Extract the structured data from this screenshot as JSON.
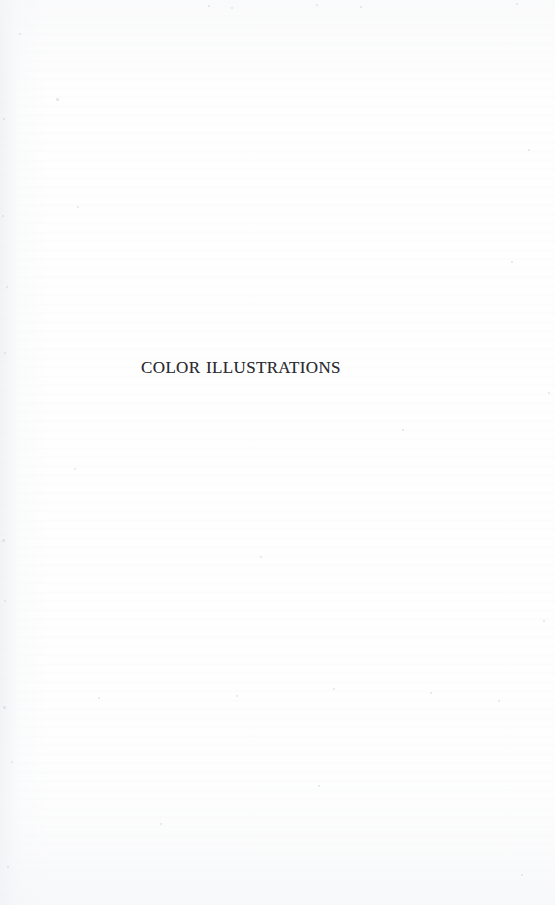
{
  "page": {
    "kind": "book-section-divider",
    "background_color": "#fefefe",
    "ink_color": "#2b2b30",
    "width": 555,
    "height": 905
  },
  "content": {
    "section_title": "COLOR ILLUSTRATIONS"
  },
  "artifacts": {
    "specks": [
      {
        "x": 19,
        "y": 33,
        "size": 2
      },
      {
        "x": 56,
        "y": 98,
        "size": 3
      },
      {
        "x": 3,
        "y": 118,
        "size": 2
      },
      {
        "x": 208,
        "y": 5,
        "size": 2
      },
      {
        "x": 231,
        "y": 7,
        "size": 2
      },
      {
        "x": 316,
        "y": 4,
        "size": 2
      },
      {
        "x": 360,
        "y": 6,
        "size": 2
      },
      {
        "x": 516,
        "y": 3,
        "size": 2
      },
      {
        "x": 2,
        "y": 215,
        "size": 2
      },
      {
        "x": 6,
        "y": 286,
        "size": 2
      },
      {
        "x": 4,
        "y": 352,
        "size": 2
      },
      {
        "x": 74,
        "y": 468,
        "size": 2
      },
      {
        "x": 402,
        "y": 429,
        "size": 2
      },
      {
        "x": 77,
        "y": 206,
        "size": 2
      },
      {
        "x": 2,
        "y": 539,
        "size": 3
      },
      {
        "x": 4,
        "y": 600,
        "size": 2
      },
      {
        "x": 3,
        "y": 706,
        "size": 3
      },
      {
        "x": 11,
        "y": 761,
        "size": 2
      },
      {
        "x": 7,
        "y": 866,
        "size": 2
      },
      {
        "x": 260,
        "y": 556,
        "size": 2
      },
      {
        "x": 333,
        "y": 688,
        "size": 2
      },
      {
        "x": 98,
        "y": 697,
        "size": 2
      },
      {
        "x": 236,
        "y": 695,
        "size": 2
      },
      {
        "x": 430,
        "y": 692,
        "size": 2
      },
      {
        "x": 498,
        "y": 700,
        "size": 2
      },
      {
        "x": 160,
        "y": 823,
        "size": 2
      },
      {
        "x": 318,
        "y": 785,
        "size": 2
      },
      {
        "x": 528,
        "y": 149,
        "size": 2
      },
      {
        "x": 511,
        "y": 261,
        "size": 2
      },
      {
        "x": 548,
        "y": 392,
        "size": 2
      },
      {
        "x": 543,
        "y": 620,
        "size": 2
      },
      {
        "x": 521,
        "y": 874,
        "size": 2
      }
    ]
  }
}
